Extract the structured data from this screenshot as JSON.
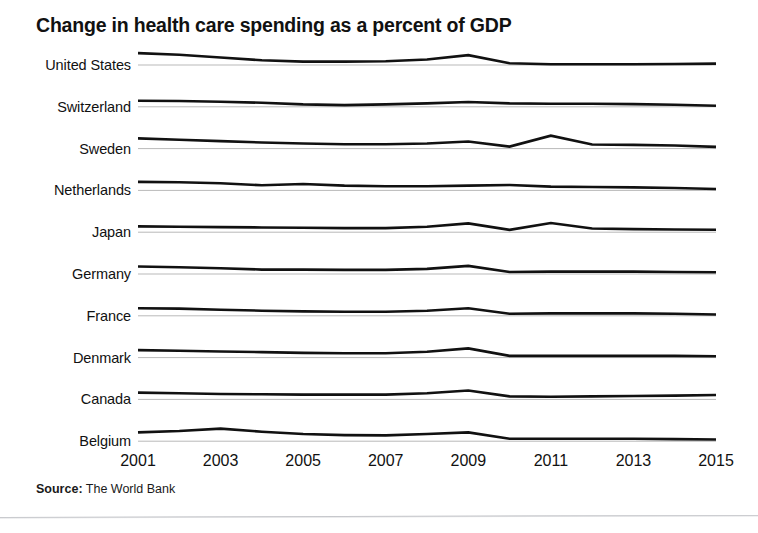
{
  "chart_data": {
    "type": "line",
    "title": "Change in health care spending as a percent of GDP",
    "subtitle": "",
    "xlabel": "",
    "ylabel": "",
    "source_label": "Source:",
    "source_value": "The World Bank",
    "legend_position": "left-row-labels",
    "grid": false,
    "style": "sparkline-small-multiples",
    "baseline_reference": true,
    "x": [
      2001,
      2002,
      2003,
      2004,
      2005,
      2006,
      2007,
      2008,
      2009,
      2010,
      2011,
      2012,
      2013,
      2014,
      2015
    ],
    "x_tick_labels": [
      "2001",
      "2003",
      "2005",
      "2007",
      "2009",
      "2011",
      "2013",
      "2015"
    ],
    "x_tick_values": [
      2001,
      2003,
      2005,
      2007,
      2009,
      2011,
      2013,
      2015
    ],
    "xlim": [
      2001,
      2015
    ],
    "series": [
      {
        "name": "United States",
        "values": [
          0.35,
          0.3,
          0.22,
          0.14,
          0.1,
          0.1,
          0.11,
          0.16,
          0.29,
          0.05,
          0.02,
          0.02,
          0.02,
          0.03,
          0.04
        ]
      },
      {
        "name": "Switzerland",
        "values": [
          0.18,
          0.17,
          0.15,
          0.12,
          0.07,
          0.05,
          0.07,
          0.1,
          0.14,
          0.1,
          0.09,
          0.09,
          0.08,
          0.06,
          0.03
        ]
      },
      {
        "name": "Sweden",
        "values": [
          0.3,
          0.26,
          0.22,
          0.18,
          0.15,
          0.13,
          0.13,
          0.15,
          0.21,
          0.06,
          0.38,
          0.12,
          0.11,
          0.09,
          0.05
        ]
      },
      {
        "name": "Netherlands",
        "values": [
          0.25,
          0.24,
          0.21,
          0.15,
          0.19,
          0.14,
          0.12,
          0.12,
          0.14,
          0.16,
          0.11,
          0.1,
          0.09,
          0.07,
          0.04
        ]
      },
      {
        "name": "Japan",
        "values": [
          0.17,
          0.16,
          0.15,
          0.14,
          0.13,
          0.12,
          0.12,
          0.16,
          0.26,
          0.07,
          0.27,
          0.11,
          0.09,
          0.08,
          0.07
        ]
      },
      {
        "name": "Germany",
        "values": [
          0.22,
          0.2,
          0.17,
          0.13,
          0.13,
          0.12,
          0.12,
          0.15,
          0.24,
          0.06,
          0.07,
          0.07,
          0.07,
          0.06,
          0.05
        ]
      },
      {
        "name": "France",
        "values": [
          0.22,
          0.21,
          0.18,
          0.15,
          0.13,
          0.12,
          0.12,
          0.15,
          0.22,
          0.06,
          0.07,
          0.07,
          0.07,
          0.06,
          0.04
        ]
      },
      {
        "name": "Denmark",
        "values": [
          0.22,
          0.2,
          0.18,
          0.16,
          0.14,
          0.13,
          0.13,
          0.17,
          0.27,
          0.05,
          0.05,
          0.05,
          0.05,
          0.05,
          0.04
        ]
      },
      {
        "name": "Canada",
        "values": [
          0.2,
          0.18,
          0.16,
          0.15,
          0.14,
          0.14,
          0.14,
          0.18,
          0.26,
          0.09,
          0.08,
          0.09,
          0.1,
          0.11,
          0.13
        ]
      },
      {
        "name": "Belgium",
        "values": [
          0.26,
          0.3,
          0.37,
          0.28,
          0.21,
          0.18,
          0.17,
          0.21,
          0.26,
          0.07,
          0.07,
          0.07,
          0.07,
          0.06,
          0.05
        ]
      }
    ],
    "colors": {
      "line": "#111111",
      "baseline": "#b9b9b9",
      "text": "#111111",
      "background": "#ffffff",
      "divider": "#aaacb2"
    }
  }
}
